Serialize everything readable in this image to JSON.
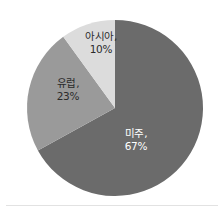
{
  "chart_data": {
    "type": "pie",
    "title": "",
    "subtitle": "",
    "xlabel": "",
    "ylabel": "",
    "legend_position": "none",
    "grid": false,
    "labels_inside": true,
    "start_angle_deg": 0,
    "direction": "clockwise",
    "categories": [
      "미주",
      "유럽",
      "아시아"
    ],
    "values": [
      67,
      23,
      10
    ],
    "value_unit": "%",
    "colors": [
      "#6b6b6b",
      "#9a9a9a",
      "#dcdcdc"
    ],
    "slices": [
      {
        "name": "미주",
        "value": 67,
        "value_text": "67%",
        "label_text": "미주,",
        "color": "#6b6b6b",
        "label_color": "#ffffff",
        "start_deg": 0,
        "end_deg": 241.2
      },
      {
        "name": "유럽",
        "value": 23,
        "value_text": "23%",
        "label_text": "유럽,",
        "color": "#9a9a9a",
        "label_color": "#2b2b2b",
        "start_deg": 241.2,
        "end_deg": 324.0
      },
      {
        "name": "아시아",
        "value": 10,
        "value_text": "10%",
        "label_text": "아시아,",
        "color": "#dcdcdc",
        "label_color": "#2b2b2b",
        "start_deg": 324.0,
        "end_deg": 360.0
      }
    ]
  },
  "canvas": {
    "background": "#ffffff",
    "divider_color": "#e2e2e2"
  }
}
